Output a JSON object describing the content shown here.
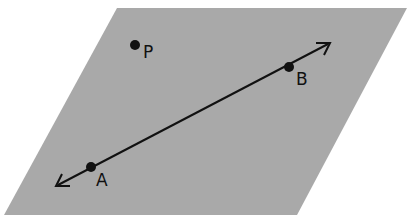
{
  "diagram": {
    "type": "geometry-plane",
    "colors": {
      "background": "#ffffff",
      "plane": "#a9a9a9",
      "ink": "#111111"
    },
    "plane": {
      "vertices": [
        [
          117,
          8
        ],
        [
          407,
          8
        ],
        [
          297,
          215
        ],
        [
          4,
          215
        ]
      ]
    },
    "line": {
      "from": [
        56,
        186
      ],
      "to": [
        330,
        43
      ],
      "arrows": "both"
    },
    "points": [
      {
        "id": "P",
        "label": "P",
        "x": 135,
        "y": 45,
        "label_x": 143,
        "label_y": 58
      },
      {
        "id": "B",
        "label": "B",
        "x": 289,
        "y": 67,
        "label_x": 296,
        "label_y": 85
      },
      {
        "id": "A",
        "label": "A",
        "x": 91,
        "y": 167,
        "label_x": 96,
        "label_y": 186
      }
    ]
  }
}
